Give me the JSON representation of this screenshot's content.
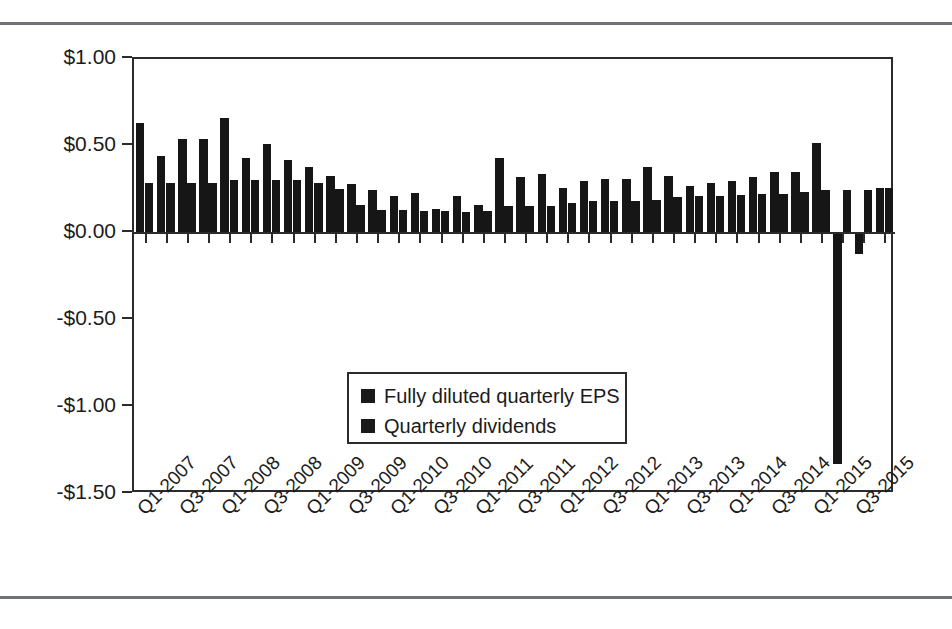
{
  "figure": {
    "has_top_rule": true,
    "has_bottom_rule": true,
    "rule_color": "#6f7276",
    "background": "#ffffff"
  },
  "legend": {
    "position": "inside-left-lower",
    "entries": [
      {
        "label": "Fully diluted quarterly EPS",
        "color": "#1a1a1a"
      },
      {
        "label": "Quarterly dividends",
        "color": "#1a1a1a"
      }
    ]
  },
  "axis": {
    "y_tick_labels": [
      "$1.00",
      "$0.50",
      "$0.00",
      "-$0.50",
      "-$1.00",
      "-$1.50"
    ],
    "y_tick_values": [
      1.0,
      0.5,
      0.0,
      -0.5,
      -1.0,
      -1.5
    ],
    "x_tick_labels": [
      "Q1-2007",
      "Q3-2007",
      "Q1-2008",
      "Q3-2008",
      "Q1-2009",
      "Q3-2009",
      "Q1-2010",
      "Q3-2010",
      "Q1-2011",
      "Q3-2011",
      "Q1-2012",
      "Q3-2012",
      "Q1-2013",
      "Q3-2013",
      "Q1-2014",
      "Q3-2014",
      "Q1-2015",
      "Q3-2015"
    ]
  },
  "chart_data": {
    "type": "bar",
    "title": "",
    "subtitle": "",
    "xlabel": "",
    "ylabel": "",
    "ylim": [
      -1.5,
      1.0
    ],
    "ytick_step": 0.5,
    "grid": false,
    "legend_position": "inside lower-left of plot area",
    "bar_color": "#161616",
    "categories": [
      "Q1-2007",
      "Q2-2007",
      "Q3-2007",
      "Q4-2007",
      "Q1-2008",
      "Q2-2008",
      "Q3-2008",
      "Q4-2008",
      "Q1-2009",
      "Q2-2009",
      "Q3-2009",
      "Q4-2009",
      "Q1-2010",
      "Q2-2010",
      "Q3-2010",
      "Q4-2010",
      "Q1-2011",
      "Q2-2011",
      "Q3-2011",
      "Q4-2011",
      "Q1-2012",
      "Q2-2012",
      "Q3-2012",
      "Q4-2012",
      "Q1-2013",
      "Q2-2013",
      "Q3-2013",
      "Q4-2013",
      "Q1-2014",
      "Q2-2014",
      "Q3-2014",
      "Q4-2014",
      "Q1-2015",
      "Q2-2015",
      "Q3-2015",
      "Q4-2015"
    ],
    "series": [
      {
        "name": "Fully diluted quarterly EPS",
        "color": "#161616",
        "values": [
          0.63,
          0.44,
          0.54,
          0.54,
          0.66,
          0.43,
          0.51,
          0.42,
          0.38,
          0.33,
          0.28,
          0.25,
          0.21,
          0.23,
          0.14,
          0.21,
          0.16,
          0.43,
          0.32,
          0.34,
          0.26,
          0.3,
          0.31,
          0.31,
          0.38,
          0.33,
          0.27,
          0.29,
          0.3,
          0.32,
          0.35,
          0.35,
          0.52,
          -1.33,
          -0.12,
          0.26
        ]
      },
      {
        "name": "Quarterly dividends",
        "color": "#161616",
        "values": [
          0.285,
          0.285,
          0.285,
          0.285,
          0.305,
          0.305,
          0.305,
          0.305,
          0.29,
          0.255,
          0.16,
          0.13,
          0.13,
          0.125,
          0.125,
          0.12,
          0.125,
          0.155,
          0.155,
          0.155,
          0.175,
          0.185,
          0.185,
          0.185,
          0.19,
          0.205,
          0.215,
          0.215,
          0.22,
          0.225,
          0.225,
          0.235,
          0.25,
          0.25,
          0.25,
          0.26
        ]
      }
    ]
  }
}
